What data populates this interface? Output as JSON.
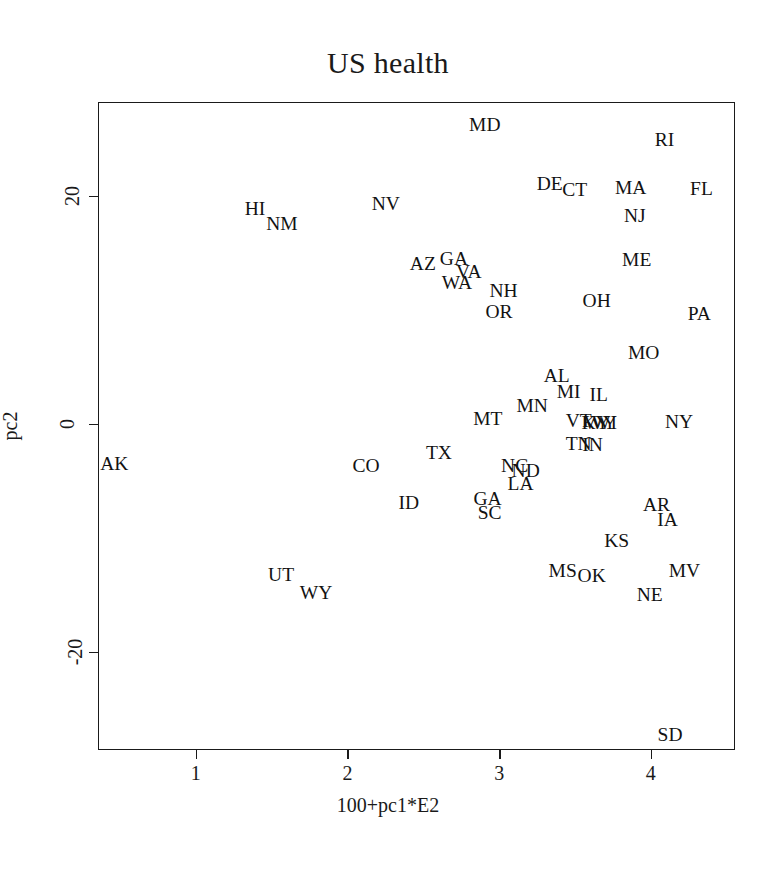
{
  "chart_data": {
    "type": "scatter",
    "title": "US health",
    "xlabel": "100+pc1*E2",
    "ylabel": "pc2",
    "grid": false,
    "legend": null,
    "xlim": [
      0.355,
      4.555
    ],
    "ylim": [
      -28.6,
      28.2
    ],
    "xticks": [
      1,
      2,
      3,
      4
    ],
    "xtick_labels": [
      "1",
      "2",
      "3",
      "4"
    ],
    "yticks": [
      20,
      0,
      -20
    ],
    "ytick_labels": [
      "20",
      "0",
      "-20"
    ],
    "point_label_kind": "state-abbreviation",
    "points": [
      {
        "label": "MD",
        "x": 2.905,
        "y": 26.22
      },
      {
        "label": "RI",
        "x": 4.09,
        "y": 24.91
      },
      {
        "label": "DE",
        "x": 3.333,
        "y": 21.0
      },
      {
        "label": "FL",
        "x": 4.334,
        "y": 20.56
      },
      {
        "label": "HI",
        "x": 1.39,
        "y": 18.84
      },
      {
        "label": "MA",
        "x": 3.867,
        "y": 20.65
      },
      {
        "label": "CT",
        "x": 3.498,
        "y": 20.47
      },
      {
        "label": "NV",
        "x": 2.253,
        "y": 19.24
      },
      {
        "label": "NJ",
        "x": 3.894,
        "y": 18.22
      },
      {
        "label": "NM",
        "x": 1.568,
        "y": 17.55
      },
      {
        "label": "ME",
        "x": 3.907,
        "y": 14.35
      },
      {
        "label": "GA",
        "x": 2.702,
        "y": 14.45
      },
      {
        "label": "VA",
        "x": 2.8,
        "y": 13.3
      },
      {
        "label": "AZ",
        "x": 2.497,
        "y": 14.01
      },
      {
        "label": "WA",
        "x": 2.721,
        "y": 12.34
      },
      {
        "label": "OH",
        "x": 3.643,
        "y": 10.79
      },
      {
        "label": "NH",
        "x": 3.029,
        "y": 11.66
      },
      {
        "label": "PA",
        "x": 4.32,
        "y": 9.65
      },
      {
        "label": "OR",
        "x": 2.999,
        "y": 9.83
      },
      {
        "label": "MO",
        "x": 3.953,
        "y": 6.19
      },
      {
        "label": "AL",
        "x": 3.379,
        "y": 4.22
      },
      {
        "label": "MI",
        "x": 3.458,
        "y": 2.82
      },
      {
        "label": "IL",
        "x": 3.656,
        "y": 2.56
      },
      {
        "label": "MN",
        "x": 3.218,
        "y": 1.51
      },
      {
        "label": "MT",
        "x": 2.925,
        "y": 0.37
      },
      {
        "label": "VT",
        "x": 3.524,
        "y": 0.2
      },
      {
        "label": "KY",
        "x": 3.636,
        "y": 0.02
      },
      {
        "label": "WI",
        "x": 3.695,
        "y": 0.02
      },
      {
        "label": "WY",
        "x": 3.669,
        "y": 0.02
      },
      {
        "label": "NY",
        "x": 4.186,
        "y": 0.15
      },
      {
        "label": "TN",
        "x": 3.524,
        "y": -1.76
      },
      {
        "label": "IN",
        "x": 3.616,
        "y": -1.85
      },
      {
        "label": "TX",
        "x": 2.603,
        "y": -2.58
      },
      {
        "label": "AK",
        "x": 0.463,
        "y": -3.54
      },
      {
        "label": "CO",
        "x": 2.122,
        "y": -3.72
      },
      {
        "label": "NC",
        "x": 3.102,
        "y": -3.72
      },
      {
        "label": "ND",
        "x": 3.175,
        "y": -4.16
      },
      {
        "label": "LA",
        "x": 3.141,
        "y": -5.3
      },
      {
        "label": "GA2",
        "x": 2.923,
        "y": -6.62
      },
      {
        "label": "ID",
        "x": 2.405,
        "y": -6.97
      },
      {
        "label": "SC",
        "x": 2.937,
        "y": -7.85
      },
      {
        "label": "AR",
        "x": 4.037,
        "y": -7.15
      },
      {
        "label": "IA",
        "x": 4.11,
        "y": -8.46
      },
      {
        "label": "KS",
        "x": 3.775,
        "y": -10.31
      },
      {
        "label": "MS",
        "x": 3.419,
        "y": -12.94
      },
      {
        "label": "MV",
        "x": 4.222,
        "y": -12.94
      },
      {
        "label": "OK",
        "x": 3.61,
        "y": -13.38
      },
      {
        "label": "UT",
        "x": 1.562,
        "y": -13.29
      },
      {
        "label": "NE",
        "x": 3.993,
        "y": -15.04
      },
      {
        "label": "WY2",
        "x": 1.793,
        "y": -14.87
      },
      {
        "label": "SD",
        "x": 4.127,
        "y": -27.3
      }
    ]
  },
  "labels": {
    "MD": "MD",
    "RI": "RI",
    "DE": "DE",
    "FL": "FL",
    "HI": "HI",
    "MA": "MA",
    "CT": "CT",
    "NV": "NV",
    "NJ": "NJ",
    "NM": "NM",
    "ME": "ME",
    "GA": "GA",
    "VA": "VA",
    "AZ": "AZ",
    "WA": "WA",
    "OH": "OH",
    "NH": "NH",
    "PA": "PA",
    "OR": "OR",
    "MO": "MO",
    "AL": "AL",
    "MI": "MI",
    "IL": "IL",
    "MN": "MN",
    "MT": "MT",
    "VT": "VT",
    "KY": "KY",
    "WI": "WI",
    "WY": "WY",
    "NY": "NY",
    "TN": "TN",
    "IN": "IN",
    "TX": "TX",
    "AK": "AK",
    "CO": "CO",
    "NC": "NC",
    "ND": "ND",
    "LA": "LA",
    "GA2": "GA",
    "ID": "ID",
    "SC": "SC",
    "AR": "AR",
    "IA": "IA",
    "KS": "KS",
    "MS": "MS",
    "MV": "MV",
    "OK": "OK",
    "UT": "UT",
    "NE": "NE",
    "WY2": "WY",
    "SD": "SD"
  }
}
